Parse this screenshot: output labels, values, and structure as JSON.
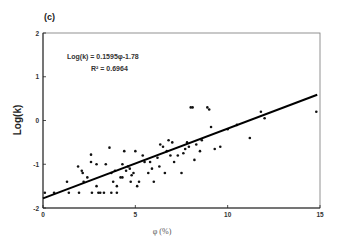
{
  "panel_label": "(c)",
  "annotation": {
    "equation": "Log(k) = 0.1595φ-1.78",
    "r2": "R² = 0.6964"
  },
  "chart_data": {
    "type": "scatter",
    "title": "(c)",
    "xlabel": "φ (%)",
    "ylabel": "Log(k)",
    "xlim": [
      0,
      15
    ],
    "ylim": [
      -2,
      2
    ],
    "xticks": [
      0,
      5,
      10,
      15
    ],
    "yticks": [
      -2,
      -1,
      0,
      1,
      2
    ],
    "grid": false,
    "legend": null,
    "fit": {
      "type": "linear",
      "slope": 0.1595,
      "intercept": -1.78,
      "r2": 0.6964,
      "x_range": [
        0,
        15
      ]
    },
    "series": [
      {
        "name": "data",
        "points": [
          [
            0.1,
            -1.65
          ],
          [
            0.6,
            -1.65
          ],
          [
            1.3,
            -1.4
          ],
          [
            1.4,
            -1.65
          ],
          [
            1.9,
            -1.05
          ],
          [
            1.95,
            -1.65
          ],
          [
            2.1,
            -1.15
          ],
          [
            2.15,
            -1.2
          ],
          [
            2.2,
            -1.4
          ],
          [
            2.4,
            -1.3
          ],
          [
            2.6,
            -0.78
          ],
          [
            2.6,
            -0.95
          ],
          [
            2.65,
            -1.65
          ],
          [
            2.9,
            -1.0
          ],
          [
            2.9,
            -1.5
          ],
          [
            3.0,
            -1.65
          ],
          [
            3.1,
            -1.65
          ],
          [
            3.3,
            -1.65
          ],
          [
            3.4,
            -1.0
          ],
          [
            3.6,
            -0.62
          ],
          [
            3.7,
            -1.2
          ],
          [
            3.7,
            -1.65
          ],
          [
            3.8,
            -1.4
          ],
          [
            3.9,
            -1.15
          ],
          [
            4.0,
            -1.5
          ],
          [
            4.0,
            -1.65
          ],
          [
            4.2,
            -1.3
          ],
          [
            4.3,
            -1.0
          ],
          [
            4.3,
            -1.3
          ],
          [
            4.4,
            -0.7
          ],
          [
            4.5,
            -1.15
          ],
          [
            4.6,
            -1.05
          ],
          [
            4.7,
            -1.1
          ],
          [
            4.75,
            -1.4
          ],
          [
            4.8,
            -1.25
          ],
          [
            4.9,
            -1.2
          ],
          [
            5.0,
            -0.7
          ],
          [
            5.1,
            -1.5
          ],
          [
            5.2,
            -1.4
          ],
          [
            5.4,
            -0.8
          ],
          [
            5.5,
            -0.95
          ],
          [
            5.7,
            -1.2
          ],
          [
            5.8,
            -0.95
          ],
          [
            5.9,
            -1.1
          ],
          [
            6.0,
            -1.4
          ],
          [
            6.2,
            -0.85
          ],
          [
            6.3,
            -1.05
          ],
          [
            6.35,
            -0.55
          ],
          [
            6.5,
            -0.6
          ],
          [
            6.6,
            -1.2
          ],
          [
            6.7,
            -0.7
          ],
          [
            6.8,
            -0.45
          ],
          [
            6.9,
            -0.8
          ],
          [
            7.0,
            -0.5
          ],
          [
            7.1,
            -0.95
          ],
          [
            7.3,
            -0.8
          ],
          [
            7.5,
            -1.2
          ],
          [
            7.6,
            -0.75
          ],
          [
            7.7,
            -0.65
          ],
          [
            7.8,
            -0.5
          ],
          [
            7.9,
            -0.6
          ],
          [
            8.0,
            0.3
          ],
          [
            8.1,
            0.3
          ],
          [
            8.2,
            -0.9
          ],
          [
            8.3,
            -0.55
          ],
          [
            8.5,
            -0.7
          ],
          [
            8.6,
            -0.45
          ],
          [
            8.9,
            0.3
          ],
          [
            9.0,
            0.25
          ],
          [
            9.1,
            -0.15
          ],
          [
            9.3,
            -0.65
          ],
          [
            9.6,
            -0.6
          ],
          [
            10.0,
            -0.2
          ],
          [
            10.5,
            -0.1
          ],
          [
            11.2,
            -0.4
          ],
          [
            11.8,
            0.2
          ],
          [
            12.0,
            0.05
          ],
          [
            14.8,
            0.2
          ]
        ]
      }
    ]
  }
}
